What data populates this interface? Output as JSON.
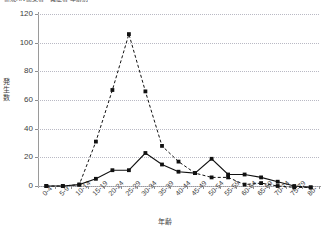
{
  "title": "新規HIV感染者・発症者 年齢別",
  "axis": {
    "x_title": "年齢",
    "y_title": "発生数"
  },
  "chart_data": {
    "type": "line",
    "title": "新規HIV感染者・発症者 年齢別",
    "xlabel": "年齢",
    "ylabel": "発生数",
    "ylim": [
      0,
      120
    ],
    "ytick_values": [
      0,
      20,
      40,
      60,
      80,
      100,
      120
    ],
    "grid": true,
    "legend": "none",
    "categories": [
      "0-4",
      "5-9",
      "10-14",
      "15-19",
      "20-24",
      "25-29",
      "30-34",
      "35-39",
      "40-44",
      "45-49",
      "50-54",
      "55-59",
      "60-64",
      "65-69",
      "70-74",
      "75-79",
      "80-"
    ],
    "series": [
      {
        "name": "series-dashed",
        "style": "dashed",
        "marker": "square",
        "color": "#111111",
        "values": [
          0,
          0,
          1,
          31,
          67,
          106,
          66,
          28,
          17,
          9,
          6,
          6,
          1,
          2,
          0,
          -1,
          -1
        ]
      },
      {
        "name": "series-solid",
        "style": "solid",
        "marker": "square",
        "color": "#111111",
        "values": [
          0,
          0,
          1,
          5,
          11,
          11,
          23,
          15,
          10,
          9,
          19,
          8,
          8,
          6,
          3,
          0,
          -1
        ]
      }
    ]
  },
  "ytick_labels": [
    "120",
    "100",
    "80",
    "60",
    "40",
    "20",
    "0"
  ],
  "colors": {
    "grid": "#b9b9c4",
    "axis": "#9a9a9a",
    "series": "#111111",
    "background": "#ffffff"
  }
}
